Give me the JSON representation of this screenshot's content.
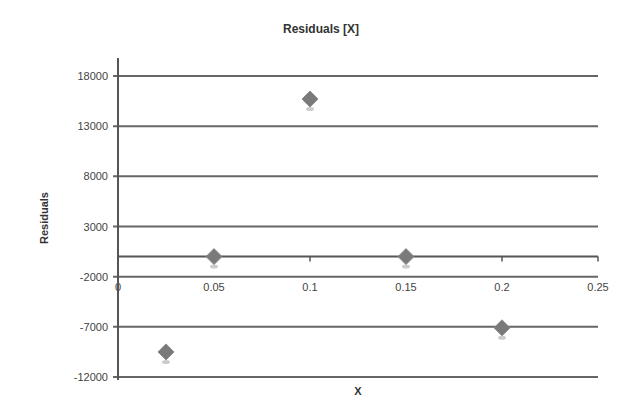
{
  "chart_data": {
    "type": "scatter",
    "title": "Residuals [X]",
    "xlabel": "X",
    "ylabel": "Residuals",
    "x_ticks": [
      "0",
      "0.05",
      "0.1",
      "0.15",
      "0.2",
      "0.25"
    ],
    "y_ticks": [
      "18000",
      "13000",
      "8000",
      "3000",
      "-2000",
      "-7000",
      "-12000"
    ],
    "xlim": [
      0,
      0.25
    ],
    "ylim": [
      -12000,
      18000
    ],
    "grid": "horizontal",
    "legend": "none",
    "series": [
      {
        "name": "Residuals",
        "marker": "diamond",
        "color": "#7a7a7a",
        "x": [
          0.025,
          0.05,
          0.1,
          0.15,
          0.2
        ],
        "y": [
          -9500,
          0,
          15700,
          0,
          -7100
        ]
      }
    ]
  },
  "colors": {
    "gridline": "#666666",
    "axis": "#555555",
    "marker": "#7a7a7a",
    "background": "#ffffff"
  }
}
